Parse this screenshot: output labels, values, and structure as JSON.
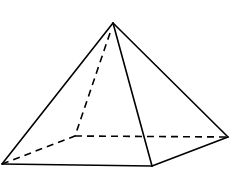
{
  "figure": {
    "colors": {
      "background": "#ffffff",
      "stroke": "#000000"
    },
    "vertices": {
      "apex": [
        113,
        23
      ],
      "front_left": [
        2,
        164
      ],
      "front_right": [
        152,
        166
      ],
      "back_right": [
        228,
        137
      ],
      "back_left": [
        75,
        136
      ]
    },
    "edges_visible": [
      [
        "apex",
        "front_left"
      ],
      [
        "apex",
        "front_right"
      ],
      [
        "apex",
        "back_right"
      ],
      [
        "front_left",
        "front_right"
      ],
      [
        "front_right",
        "back_right"
      ]
    ],
    "edges_hidden": [
      [
        "apex",
        "back_left"
      ],
      [
        "front_left",
        "back_left"
      ],
      [
        "back_left",
        "back_right"
      ]
    ]
  }
}
